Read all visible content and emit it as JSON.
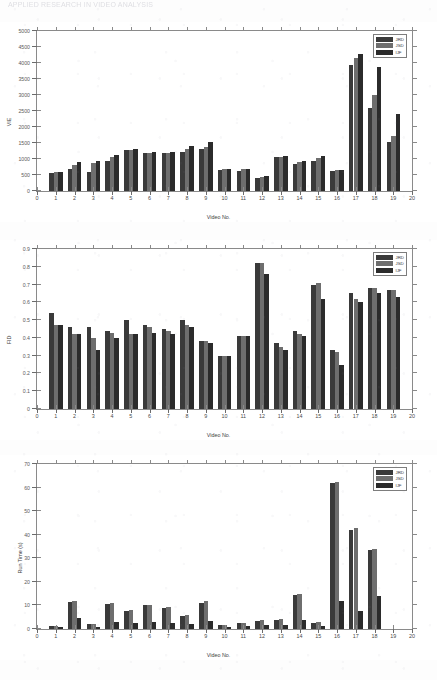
{
  "document": {
    "header_text": "APPLIED RESEARCH IN VIDEO ANALYSIS"
  },
  "legend": {
    "entries": [
      {
        "label": "JRD",
        "color": "#3a3a3a"
      },
      {
        "label": "JSD",
        "color": "#6e6e6e"
      },
      {
        "label": "IJF",
        "color": "#2b2b2b"
      }
    ]
  },
  "chart_data": [
    {
      "type": "bar",
      "title": "",
      "xlabel": "Video No.",
      "ylabel": "VIE",
      "xlim": [
        0,
        20
      ],
      "ylim": [
        0,
        5000
      ],
      "yticks": [
        0,
        500,
        1000,
        1500,
        2000,
        2500,
        3000,
        3500,
        4000,
        4500,
        5000
      ],
      "xticks": [
        0,
        1,
        2,
        3,
        4,
        5,
        6,
        7,
        8,
        9,
        10,
        11,
        12,
        13,
        14,
        15,
        16,
        17,
        18,
        19,
        20
      ],
      "grid": false,
      "legend_position": "top-right",
      "categories": [
        1,
        2,
        3,
        4,
        5,
        6,
        7,
        8,
        9,
        10,
        11,
        12,
        13,
        14,
        15,
        16,
        17,
        18,
        19
      ],
      "series": [
        {
          "name": "JRD",
          "values": [
            560,
            700,
            600,
            950,
            1280,
            1180,
            1180,
            1230,
            1300,
            660,
            640,
            400,
            1060,
            830,
            940,
            610,
            3950,
            2580,
            1520
          ]
        },
        {
          "name": "JSD",
          "values": [
            600,
            820,
            860,
            1070,
            1290,
            1180,
            1190,
            1310,
            1370,
            680,
            690,
            450,
            1060,
            900,
            1040,
            650,
            4170,
            3000,
            1720
          ]
        },
        {
          "name": "IJF",
          "values": [
            600,
            900,
            930,
            1130,
            1300,
            1220,
            1230,
            1400,
            1540,
            690,
            700,
            480,
            1080,
            930,
            1100,
            650,
            4270,
            3870,
            2420
          ]
        }
      ]
    },
    {
      "type": "bar",
      "title": "",
      "xlabel": "Video No.",
      "ylabel": "FID",
      "xlim": [
        0,
        20
      ],
      "ylim": [
        0,
        0.9
      ],
      "yticks": [
        0,
        0.1,
        0.2,
        0.3,
        0.4,
        0.5,
        0.6,
        0.7,
        0.8,
        0.9
      ],
      "xticks": [
        0,
        1,
        2,
        3,
        4,
        5,
        6,
        7,
        8,
        9,
        10,
        11,
        12,
        13,
        14,
        15,
        16,
        17,
        18,
        19,
        20
      ],
      "grid": false,
      "legend_position": "top-right",
      "categories": [
        1,
        2,
        3,
        4,
        5,
        6,
        7,
        8,
        9,
        10,
        11,
        12,
        13,
        14,
        15,
        16,
        17,
        18,
        19
      ],
      "series": [
        {
          "name": "JRD",
          "values": [
            0.54,
            0.46,
            0.46,
            0.44,
            0.5,
            0.47,
            0.45,
            0.5,
            0.38,
            0.3,
            0.41,
            0.82,
            0.37,
            0.44,
            0.7,
            0.33,
            0.65,
            0.68,
            0.67
          ]
        },
        {
          "name": "JSD",
          "values": [
            0.47,
            0.42,
            0.4,
            0.43,
            0.42,
            0.46,
            0.44,
            0.47,
            0.38,
            0.3,
            0.41,
            0.82,
            0.35,
            0.42,
            0.71,
            0.32,
            0.62,
            0.68,
            0.67
          ]
        },
        {
          "name": "IJF",
          "values": [
            0.47,
            0.42,
            0.33,
            0.4,
            0.42,
            0.43,
            0.42,
            0.46,
            0.37,
            0.3,
            0.41,
            0.76,
            0.33,
            0.41,
            0.62,
            0.25,
            0.6,
            0.65,
            0.63
          ]
        }
      ]
    },
    {
      "type": "bar",
      "title": "",
      "xlabel": "Video No.",
      "ylabel": "Run Time (s)",
      "xlim": [
        0,
        20
      ],
      "ylim": [
        0,
        70
      ],
      "yticks": [
        0,
        10,
        20,
        30,
        40,
        50,
        60,
        70
      ],
      "xticks": [
        0,
        1,
        2,
        3,
        4,
        5,
        6,
        7,
        8,
        9,
        10,
        11,
        12,
        13,
        14,
        15,
        16,
        17,
        18,
        19,
        20
      ],
      "grid": false,
      "legend_position": "top-right",
      "categories": [
        1,
        2,
        3,
        4,
        5,
        6,
        7,
        8,
        9,
        10,
        11,
        12,
        13,
        14,
        15,
        16,
        17,
        18,
        19
      ],
      "series": [
        {
          "name": "JRD",
          "values": [
            1.2,
            11.5,
            2.0,
            10.5,
            7.5,
            10.0,
            9.0,
            5.5,
            11.0,
            1.5,
            2.5,
            3.5,
            4.0,
            14.5,
            2.5,
            62.0,
            42.0,
            33.5,
            0.0
          ]
        },
        {
          "name": "JSD",
          "values": [
            1.4,
            12.0,
            2.2,
            11.0,
            8.0,
            10.3,
            9.5,
            6.0,
            11.8,
            1.7,
            2.7,
            3.8,
            4.2,
            15.0,
            2.8,
            62.5,
            43.0,
            34.0,
            0.0
          ]
        },
        {
          "name": "IJF",
          "values": [
            1.0,
            4.5,
            1.0,
            3.0,
            2.5,
            3.0,
            2.5,
            2.0,
            3.5,
            0.8,
            1.2,
            1.5,
            1.8,
            4.0,
            1.2,
            12.0,
            7.5,
            14.0,
            0.0
          ]
        }
      ]
    }
  ]
}
